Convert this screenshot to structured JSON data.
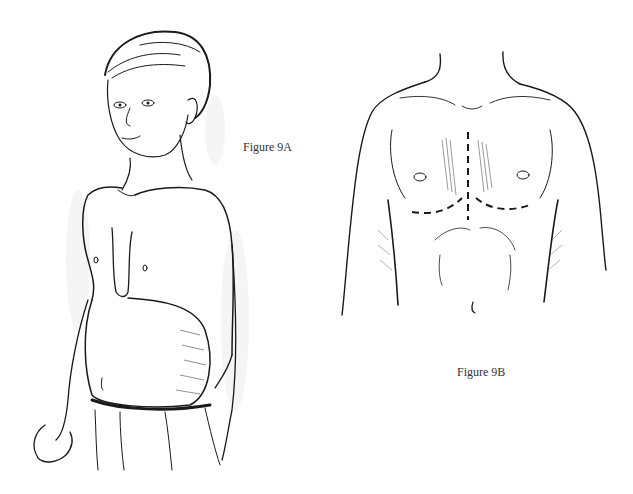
{
  "figures": [
    {
      "id": "9A",
      "caption": "Figure 9A",
      "subject": "boy-torso-three-quarter-view",
      "description": "Line drawing of a boy shown from the waist up in three-quarter view with a depressed (sunken) lower sternum"
    },
    {
      "id": "9B",
      "caption": "Figure 9B",
      "subject": "chest-frontal-view-incision-lines",
      "description": "Frontal view of an adult chest with dashed incision lines: a vertical midline line and curved inframammary lines"
    }
  ]
}
